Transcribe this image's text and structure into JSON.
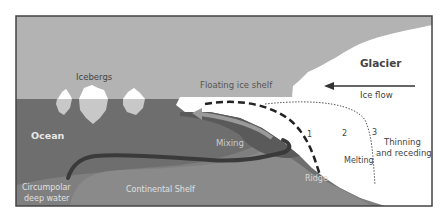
{
  "diagram": {
    "labels": {
      "icebergs": "Icebergs",
      "floating_ice_shelf": "Floating ice shelf",
      "glacier": "Glacier",
      "ice_flow": "Ice flow",
      "ocean": "Ocean",
      "mixing": "Mixing",
      "circumpolar_line1": "Circumpolar",
      "circumpolar_line2": "deep water",
      "continental_shelf": "Continental Shelf",
      "ridge": "Ridge",
      "melting": "Melting",
      "thinning_line1": "Thinning",
      "thinning_line2": "and receding",
      "stage_1": "1",
      "stage_2": "2",
      "stage_3": "3"
    },
    "colors": {
      "sky": "#b3b3b3",
      "ocean": "#6e6e6e",
      "shelf": "#8a8a8a",
      "seabed": "#7a7a7a",
      "ice": "#ffffff",
      "iceberg_under": "#c8c8c8",
      "current": "#3a3a3a",
      "frame": "#444444",
      "text_dark": "#555555",
      "text_light": "#e8e8e8"
    }
  }
}
